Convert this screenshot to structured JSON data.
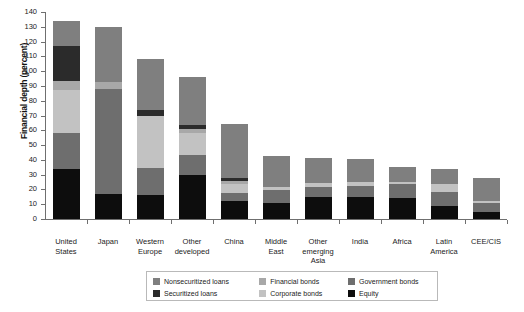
{
  "chart_data": {
    "type": "bar",
    "subtype": "stacked-vertical",
    "title": "",
    "xlabel": "",
    "ylabel": "Financial depth (percent)",
    "ylim": [
      0,
      140
    ],
    "yticks": [
      0,
      10,
      20,
      30,
      40,
      50,
      60,
      70,
      80,
      90,
      100,
      110,
      120,
      130,
      140
    ],
    "grid": false,
    "legend_position": "bottom",
    "categories": [
      "United States",
      "Japan",
      "Western Europe",
      "Other developed",
      "China",
      "Middle East",
      "Other emerging Asia",
      "India",
      "Africa",
      "Latin America",
      "CEE/CIS"
    ],
    "category_lines": [
      [
        "United",
        "States"
      ],
      [
        "Japan"
      ],
      [
        "Western",
        "Europe"
      ],
      [
        "Other",
        "developed"
      ],
      [
        "China"
      ],
      [
        "Middle",
        "East"
      ],
      [
        "Other",
        "emerging",
        "Asia"
      ],
      [
        "India"
      ],
      [
        "Africa"
      ],
      [
        "Latin",
        "America"
      ],
      [
        "CEE/CIS"
      ]
    ],
    "series": [
      {
        "name": "Equity",
        "color": "#0d0d0d",
        "values": [
          33.5,
          17.0,
          16.0,
          30.0,
          12.0,
          10.5,
          15.0,
          15.0,
          14.0,
          9.0,
          5.0
        ]
      },
      {
        "name": "Government bonds",
        "color": "#6e6e6e",
        "values": [
          25.0,
          71.0,
          18.5,
          13.5,
          5.5,
          9.0,
          6.5,
          7.5,
          9.5,
          9.5,
          6.0
        ]
      },
      {
        "name": "Corporate bonds",
        "color": "#c2c2c2",
        "values": [
          28.5,
          0.0,
          35.5,
          14.5,
          6.5,
          2.5,
          3.0,
          2.5,
          1.5,
          5.0,
          1.5
        ]
      },
      {
        "name": "Financial bonds",
        "color": "#a8a8a8",
        "values": [
          6.5,
          5.0,
          0.0,
          3.0,
          1.5,
          0.0,
          0.0,
          0.0,
          0.0,
          0.0,
          0.0
        ]
      },
      {
        "name": "Securitized loans",
        "color": "#2b2b2b",
        "values": [
          23.5,
          0.0,
          4.0,
          2.5,
          2.0,
          0.0,
          0.0,
          0.0,
          0.0,
          0.0,
          0.0
        ]
      },
      {
        "name": "Nonsecuritized loans",
        "color": "#7f7f7f",
        "values": [
          17.0,
          37.0,
          34.0,
          32.5,
          36.5,
          20.5,
          16.5,
          15.5,
          10.5,
          10.5,
          15.5
        ]
      }
    ],
    "totals": [
      134.0,
      130.0,
      108.0,
      96.0,
      64.0,
      42.5,
      41.0,
      40.5,
      35.5,
      34.0,
      28.0
    ]
  },
  "legend": {
    "items": [
      {
        "label": "Nonsecuritized loans",
        "color": "#7f7f7f"
      },
      {
        "label": "Financial bonds",
        "color": "#a8a8a8"
      },
      {
        "label": "Government bonds",
        "color": "#6e6e6e"
      },
      {
        "label": "Securitized loans",
        "color": "#2b2b2b"
      },
      {
        "label": "Corporate bonds",
        "color": "#c2c2c2"
      },
      {
        "label": "Equity",
        "color": "#0d0d0d"
      }
    ]
  }
}
